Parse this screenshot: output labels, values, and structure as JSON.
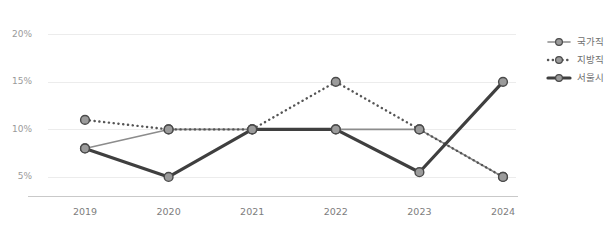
{
  "chart_data": {
    "type": "line",
    "title": "",
    "subtitle": "",
    "xlabel": "",
    "ylabel": "",
    "categories": [
      "2019",
      "2020",
      "2021",
      "2022",
      "2023",
      "2024"
    ],
    "ylim": [
      3.0,
      21.5
    ],
    "yticks": [
      5,
      10,
      15,
      20
    ],
    "ytick_labels": [
      "5%",
      "10%",
      "15%",
      "20%"
    ],
    "grid": true,
    "legend_position": "right",
    "series": [
      {
        "name": "국가직",
        "values": [
          8,
          10,
          10,
          10,
          10,
          5
        ],
        "style": "solid-thin",
        "color": "#8c8c8c",
        "marker": "circle"
      },
      {
        "name": "지방직",
        "values": [
          11,
          10,
          10,
          15,
          10,
          5
        ],
        "style": "dotted",
        "color": "#555555",
        "marker": "circle"
      },
      {
        "name": "서울시",
        "values": [
          8,
          5,
          10,
          10,
          5.5,
          15
        ],
        "style": "solid-thick",
        "color": "#3f3f3f",
        "marker": "circle"
      }
    ]
  },
  "axes": {
    "y": {
      "ticks": [
        {
          "label": "20%",
          "value": 20
        },
        {
          "label": "15%",
          "value": 15
        },
        {
          "label": "10%",
          "value": 10
        },
        {
          "label": "5%",
          "value": 5
        }
      ]
    },
    "x": {
      "ticks": [
        {
          "label": "2019"
        },
        {
          "label": "2020"
        },
        {
          "label": "2021"
        },
        {
          "label": "2022"
        },
        {
          "label": "2023"
        },
        {
          "label": "2024"
        }
      ]
    }
  },
  "legend": {
    "items": [
      {
        "label": "국가직"
      },
      {
        "label": "지방직"
      },
      {
        "label": "서울시"
      }
    ]
  },
  "colors": {
    "grid": "#ececec",
    "axis": "#c9c9c9",
    "tick_text": "#9a9a9a",
    "legend_text": "#6f6f6f",
    "marker_fill": "#9b9b9b",
    "marker_stroke": "#4a4a4a",
    "series_national": "#8c8c8c",
    "series_local": "#555555",
    "series_seoul": "#3f3f3f",
    "background": "#ffffff"
  }
}
